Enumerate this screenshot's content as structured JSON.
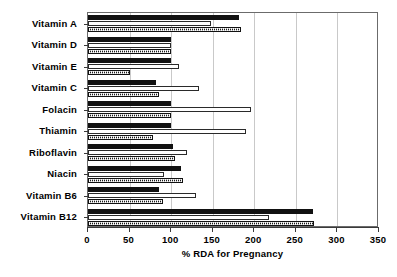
{
  "chart_data": {
    "type": "bar",
    "orientation": "horizontal",
    "title": "",
    "xlabel": "% RDA for Pregnancy",
    "ylabel": "",
    "xlim": [
      0,
      350
    ],
    "xticks": [
      0,
      50,
      100,
      150,
      200,
      250,
      300,
      350
    ],
    "xticklabels": [
      "0",
      "50",
      "100",
      "150",
      "200",
      "250",
      "300",
      "350"
    ],
    "grid": true,
    "grid_axis": "x",
    "legend": false,
    "legend_position": "none",
    "categories": [
      "Vitamin A",
      "Vitamin D",
      "Vitamin E",
      "Vitamin C",
      "Folacin",
      "Thiamin",
      "Riboflavin",
      "Niacin",
      "Vitamin B6",
      "Vitamin B12"
    ],
    "series": [
      {
        "name": "Series 1",
        "pattern": "solid-black",
        "values": [
          182,
          100,
          100,
          82,
          100,
          100,
          102,
          112,
          85,
          271
        ]
      },
      {
        "name": "Series 2",
        "pattern": "hollow-white",
        "values": [
          148,
          100,
          110,
          134,
          196,
          190,
          119,
          92,
          130,
          218
        ]
      },
      {
        "name": "Series 3",
        "pattern": "dotted-dark",
        "values": [
          184,
          100,
          50,
          85,
          100,
          78,
          105,
          114,
          90,
          272
        ]
      }
    ]
  }
}
